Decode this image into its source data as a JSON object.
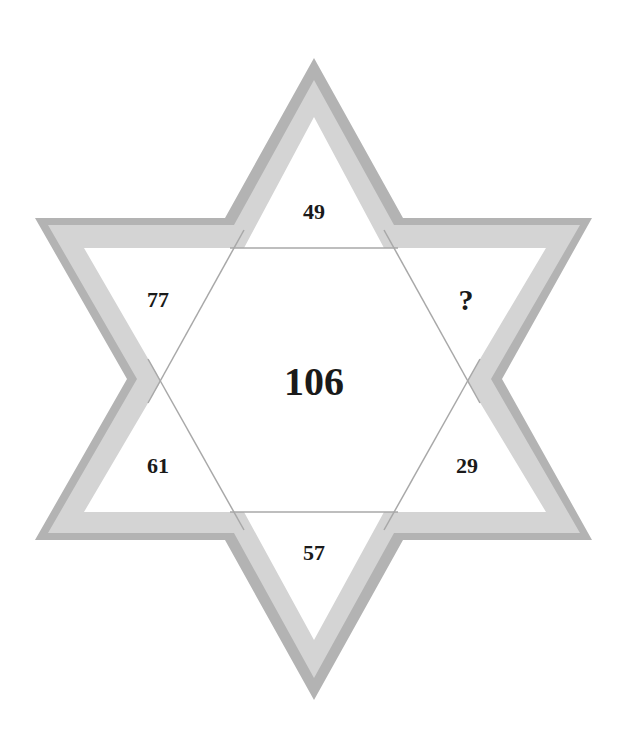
{
  "puzzle": {
    "type": "six-pointed star number puzzle",
    "center": "106",
    "points": {
      "top": "49",
      "upper_left": "77",
      "upper_right": "?",
      "lower_left": "61",
      "lower_right": "29",
      "bottom": "57"
    }
  },
  "colors": {
    "outer_band": "#b3b3b3",
    "inner_band": "#d4d4d4",
    "lines": "#a8a8a8",
    "text": "#1a1a1a",
    "background": "#ffffff"
  }
}
